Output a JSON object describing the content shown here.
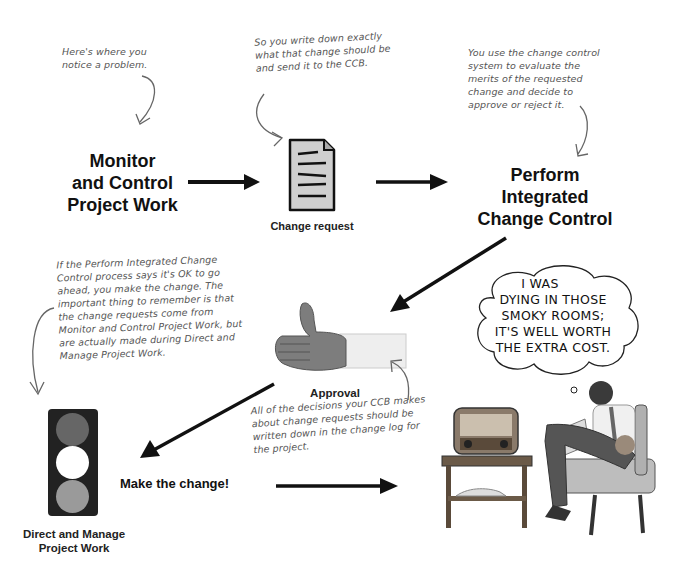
{
  "notes": {
    "notice_problem": "Here's where you notice a problem.",
    "write_down": "So you write down exactly what that change should be and send it to the CCB.",
    "evaluate": "You use the change control system to evaluate the merits of the requested change and decide to approve or reject it.",
    "make_change": "If the Perform Integrated Change Control process says it's OK to go ahead, you make the change. The important thing to remember is that the change requests come from Monitor and Control Project Work, but are actually made during Direct and Manage Project Work.",
    "change_log": "All of the decisions your CCB makes about change requests should be written down in the change log for the project."
  },
  "nodes": {
    "monitor": [
      "Monitor",
      "and Control",
      "Project Work"
    ],
    "change_request": "Change request",
    "perform": [
      "Perform",
      "Integrated",
      "Change Control"
    ],
    "approval": "Approval",
    "direct_manage": [
      "Direct and Manage",
      "Project Work"
    ],
    "make_change_label": "Make the change!"
  },
  "thought_bubble": [
    "I WAS",
    "DYING IN THOSE",
    "SMOKY ROOMS;",
    "IT'S WELL WORTH",
    "THE EXTRA COST."
  ],
  "colors": {
    "arrow": "#111111",
    "note_text": "#555555",
    "light_top": "#666666",
    "light_mid": "#ffffff",
    "light_bottom": "#999999",
    "light_housing": "#222222"
  }
}
